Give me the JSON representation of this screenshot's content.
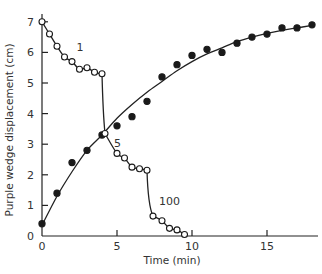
{
  "chart_data": {
    "type": "scatter",
    "title": "",
    "xlabel": "Time (min)",
    "ylabel": "Purple wedge displacement (cm)",
    "xlim": [
      0,
      18
    ],
    "ylim": [
      0,
      7
    ],
    "x_ticks": [
      0,
      5,
      10,
      15
    ],
    "y_ticks": [
      0,
      1,
      2,
      3,
      4,
      5,
      6,
      7
    ],
    "grid": false,
    "legend": null,
    "annotations": [
      {
        "text": "1",
        "x": 2.3,
        "y": 6.05
      },
      {
        "text": "5",
        "x": 4.8,
        "y": 2.9
      },
      {
        "text": "100",
        "x": 7.8,
        "y": 1.0
      }
    ],
    "series": [
      {
        "name": "filled (advancing)",
        "marker": "filled-circle",
        "fit": "curve",
        "points": [
          [
            0,
            0.4
          ],
          [
            1,
            1.4
          ],
          [
            2,
            2.4
          ],
          [
            3,
            2.8
          ],
          [
            4,
            3.3
          ],
          [
            5,
            3.6
          ],
          [
            6,
            3.9
          ],
          [
            7,
            4.4
          ],
          [
            8,
            5.2
          ],
          [
            9,
            5.6
          ],
          [
            10,
            5.9
          ],
          [
            11,
            6.1
          ],
          [
            12,
            6.0
          ],
          [
            13,
            6.3
          ],
          [
            14,
            6.5
          ],
          [
            15,
            6.6
          ],
          [
            16,
            6.8
          ],
          [
            17,
            6.8
          ],
          [
            18,
            6.9
          ]
        ],
        "curve": [
          [
            0,
            0.35
          ],
          [
            1,
            1.3
          ],
          [
            2,
            2.1
          ],
          [
            3,
            2.8
          ],
          [
            4,
            3.3
          ],
          [
            5,
            3.85
          ],
          [
            6,
            4.3
          ],
          [
            7,
            4.7
          ],
          [
            8,
            5.05
          ],
          [
            9,
            5.4
          ],
          [
            10,
            5.7
          ],
          [
            11,
            5.95
          ],
          [
            12,
            6.15
          ],
          [
            13,
            6.35
          ],
          [
            14,
            6.5
          ],
          [
            15,
            6.62
          ],
          [
            16,
            6.72
          ],
          [
            17,
            6.8
          ],
          [
            18,
            6.88
          ]
        ]
      },
      {
        "name": "1",
        "marker": "open-circle",
        "points": [
          [
            0,
            7.0
          ],
          [
            0.5,
            6.6
          ],
          [
            1,
            6.2
          ],
          [
            1.5,
            5.85
          ],
          [
            2,
            5.7
          ],
          [
            2.5,
            5.45
          ],
          [
            3,
            5.5
          ],
          [
            3.5,
            5.35
          ],
          [
            4,
            5.3
          ]
        ]
      },
      {
        "name": "5",
        "marker": "open-circle",
        "points": [
          [
            4.2,
            3.35
          ],
          [
            5,
            2.7
          ],
          [
            5.5,
            2.55
          ],
          [
            6,
            2.25
          ],
          [
            6.5,
            2.2
          ],
          [
            7,
            2.15
          ]
        ]
      },
      {
        "name": "100",
        "marker": "open-circle",
        "points": [
          [
            7.4,
            0.65
          ],
          [
            8,
            0.5
          ],
          [
            8.5,
            0.25
          ],
          [
            9,
            0.2
          ],
          [
            9.5,
            0.05
          ]
        ]
      }
    ],
    "drop_lines": [
      {
        "from": [
          4,
          5.3
        ],
        "to": [
          4.2,
          3.35
        ]
      },
      {
        "from": [
          7,
          2.15
        ],
        "to": [
          7.4,
          0.65
        ]
      }
    ]
  }
}
